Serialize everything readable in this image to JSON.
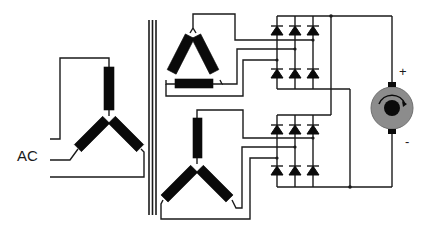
{
  "diagram": {
    "labels": {
      "ac": "AC",
      "plus": "+",
      "minus": "-"
    },
    "components": {
      "primary": "wye-primary-winding",
      "core": "transformer-core",
      "secondary_1": "delta-secondary-winding",
      "secondary_2": "wye-secondary-winding",
      "bridge_1": "three-phase-diode-bridge-upper",
      "bridge_2": "three-phase-diode-bridge-lower",
      "load": "dc-motor"
    },
    "colors": {
      "line": "#1a1a1a",
      "winding": "#0a0a0a",
      "motor_body": "#8c8c8c",
      "motor_rotor": "#0a0a0a",
      "background": "#ffffff"
    }
  }
}
